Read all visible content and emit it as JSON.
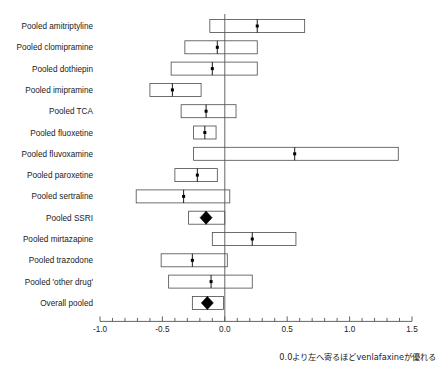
{
  "chart_data": {
    "type": "forest",
    "title": "",
    "xlabel": "0.0より左へ寄るほどvenlafaxineが優れる",
    "ylabel": "",
    "xlim": [
      -1.0,
      1.5
    ],
    "x_tick_labels": [
      "-1.0",
      "-0.5",
      "0.0",
      "0.5",
      "1.0",
      "1.5"
    ],
    "x_tick_values": [
      -1.0,
      -0.5,
      0.0,
      0.5,
      1.0,
      1.5
    ],
    "minor_tick_step": 0.1,
    "grid": false,
    "legend": "none",
    "null_line": 0.0,
    "categories": [
      "Pooled amitriptyline",
      "Pooled clomipramine",
      "Pooled dothiepin",
      "Pooled imipramine",
      "Pooled TCA",
      "Pooled fluoxetine",
      "Pooled fluvoxamine",
      "Pooled paroxetine",
      "Pooled sertraline",
      "Pooled SSRI",
      "Pooled mirtazapine",
      "Pooled trazodone",
      "Pooled 'other drug'",
      "Overall pooled"
    ],
    "rows": [
      {
        "label": "Pooled amitriptyline",
        "estimate": 0.26,
        "ci_low": -0.12,
        "ci_high": 0.64,
        "marker": "square"
      },
      {
        "label": "Pooled clomipramine",
        "estimate": -0.06,
        "ci_low": -0.32,
        "ci_high": 0.26,
        "marker": "square"
      },
      {
        "label": "Pooled dothiepin",
        "estimate": -0.1,
        "ci_low": -0.43,
        "ci_high": 0.26,
        "marker": "square"
      },
      {
        "label": "Pooled imipramine",
        "estimate": -0.42,
        "ci_low": -0.6,
        "ci_high": -0.19,
        "marker": "square"
      },
      {
        "label": "Pooled TCA",
        "estimate": -0.15,
        "ci_low": -0.35,
        "ci_high": 0.09,
        "marker": "square"
      },
      {
        "label": "Pooled fluoxetine",
        "estimate": -0.16,
        "ci_low": -0.25,
        "ci_high": -0.07,
        "marker": "square"
      },
      {
        "label": "Pooled fluvoxamine",
        "estimate": 0.56,
        "ci_low": -0.25,
        "ci_high": 1.39,
        "marker": "square"
      },
      {
        "label": "Pooled paroxetine",
        "estimate": -0.22,
        "ci_low": -0.4,
        "ci_high": -0.06,
        "marker": "square"
      },
      {
        "label": "Pooled sertraline",
        "estimate": -0.33,
        "ci_low": -0.71,
        "ci_high": 0.04,
        "marker": "square"
      },
      {
        "label": "Pooled SSRI",
        "estimate": -0.15,
        "ci_low": -0.29,
        "ci_high": 0.0,
        "marker": "diamond"
      },
      {
        "label": "Pooled mirtazapine",
        "estimate": 0.22,
        "ci_low": -0.1,
        "ci_high": 0.57,
        "marker": "square"
      },
      {
        "label": "Pooled trazodone",
        "estimate": -0.26,
        "ci_low": -0.51,
        "ci_high": 0.02,
        "marker": "square"
      },
      {
        "label": "Pooled 'other drug'",
        "estimate": -0.11,
        "ci_low": -0.45,
        "ci_high": 0.22,
        "marker": "square"
      },
      {
        "label": "Overall pooled",
        "estimate": -0.14,
        "ci_low": -0.26,
        "ci_high": -0.01,
        "marker": "diamond"
      }
    ]
  },
  "colors": {
    "box_stroke": "#4a4a4a",
    "marker": "#000000",
    "axis": "#555555",
    "background": "#ffffff",
    "text": "#1a1a1a"
  }
}
